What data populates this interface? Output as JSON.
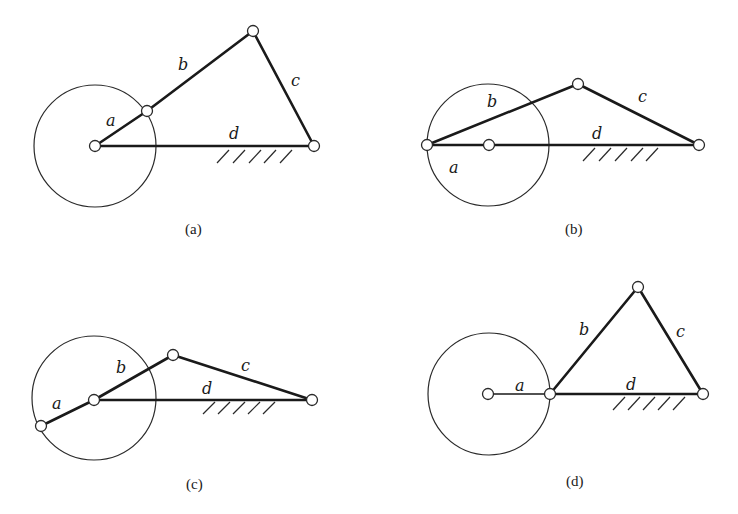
{
  "figure": {
    "panels": [
      {
        "id": "a",
        "caption": "(a)",
        "labels": {
          "a": "a",
          "b": "b",
          "c": "c",
          "d": "d"
        },
        "description": "Crank a at general position; four-bar linkage a-b-c-d"
      },
      {
        "id": "b",
        "caption": "(b)",
        "labels": {
          "a": "a",
          "b": "b",
          "c": "c",
          "d": "d"
        },
        "description": "Crank a collinear with frame d, pointing away (extended)"
      },
      {
        "id": "c",
        "caption": "(c)",
        "labels": {
          "a": "a",
          "b": "b",
          "c": "c",
          "d": "d"
        },
        "description": "Crank a collinear with coupler b"
      },
      {
        "id": "d",
        "caption": "(d)",
        "labels": {
          "a": "a",
          "b": "b",
          "c": "c",
          "d": "d"
        },
        "description": "Crank a collinear with frame d, overlapping"
      }
    ]
  }
}
